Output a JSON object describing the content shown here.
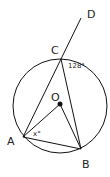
{
  "diagram": {
    "title": "",
    "points": {
      "A": {
        "label": "A"
      },
      "B": {
        "label": "B"
      },
      "C": {
        "label": "C"
      },
      "D": {
        "label": "D"
      },
      "O": {
        "label": "O"
      }
    },
    "angles": {
      "angle_at_C": "128°",
      "angle_at_A": "x°"
    },
    "colors": {
      "stroke": "#111111",
      "background": "#ffffff"
    }
  }
}
